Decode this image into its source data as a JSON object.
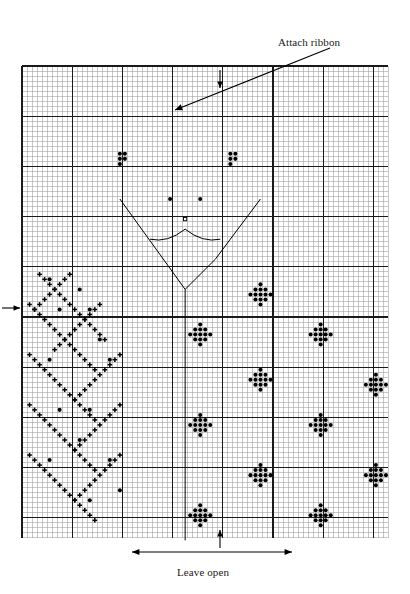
{
  "document": {
    "title": "Cross-stitch pattern chart",
    "type": "counted cross-stitch grid chart"
  },
  "annotations": {
    "attach_ribbon": {
      "text": "Attach ribbon",
      "icon": "arrow-pointer-icon",
      "points_to": "upper left area of grid"
    },
    "leave_open": {
      "text": "Leave open",
      "icon": "double-headed-arrow-icon",
      "spans": "bottom center edge of grid"
    },
    "top_marker": {
      "icon": "arrow-down-icon",
      "meaning": "vertical center top"
    },
    "bottom_marker": {
      "icon": "arrow-up-icon",
      "meaning": "vertical center bottom"
    },
    "left_marker": {
      "icon": "arrow-right-icon",
      "meaning": "horizontal center left"
    }
  },
  "colors": {
    "grid_minor": "#9a9a9a",
    "grid_major": "#1a1a1a",
    "symbol": "#000000",
    "background": "#ffffff",
    "text": "#1a1a1a"
  },
  "chart_data": {
    "type": "heatmap",
    "xlabel": "",
    "ylabel": "",
    "grid": true,
    "legend_position": "none",
    "cell_size_px": 5.02,
    "origin_px": {
      "x": 22,
      "y": 66
    },
    "columns": 73,
    "rows": 94,
    "major_gridline_interval": 10,
    "symbols": {
      "dot": "filled-round-stitch",
      "cross": "small-cross-stitch"
    },
    "motifs": {
      "flower": {
        "name": "diamond-flower-motif",
        "symbol": "dot",
        "offsets": [
          [
            0,
            -2
          ],
          [
            -1,
            -1
          ],
          [
            0,
            -1
          ],
          [
            1,
            -1
          ],
          [
            -2,
            0
          ],
          [
            -1,
            0
          ],
          [
            1,
            0
          ],
          [
            2,
            0
          ],
          [
            -1,
            1
          ],
          [
            0,
            1
          ],
          [
            1,
            1
          ],
          [
            0,
            2
          ]
        ]
      },
      "small_cross": {
        "name": "small-cross-motif",
        "symbol": "cross",
        "offsets": [
          [
            0,
            0
          ]
        ]
      },
      "eye_cluster": {
        "name": "eye-cluster-motif",
        "symbol": "dot",
        "offsets": [
          [
            0,
            0
          ],
          [
            1,
            0
          ],
          [
            0,
            1
          ],
          [
            1,
            1
          ],
          [
            0,
            2
          ]
        ]
      }
    },
    "flower_centers": [
      [
        47,
        45
      ],
      [
        35,
        53
      ],
      [
        59,
        53
      ],
      [
        47,
        62
      ],
      [
        70,
        63
      ],
      [
        35,
        71
      ],
      [
        59,
        71
      ],
      [
        47,
        81
      ],
      [
        70,
        81
      ],
      [
        35,
        89
      ],
      [
        59,
        89
      ]
    ],
    "eye_clusters": [
      [
        19,
        17
      ],
      [
        41,
        17
      ]
    ],
    "pupils": [
      [
        29,
        26
      ],
      [
        35,
        26
      ]
    ],
    "nose": [
      [
        32,
        30
      ]
    ],
    "mouth_curve": {
      "left_start": [
        25,
        34
      ],
      "dip": [
        32,
        32
      ],
      "right_end": [
        39,
        34
      ]
    },
    "chevron": {
      "left": [
        19,
        26
      ],
      "vertex": [
        32,
        44
      ],
      "right": [
        47,
        26
      ],
      "notch": [
        38,
        38
      ]
    },
    "center_line": {
      "x": 32,
      "from_y": 44,
      "to_y": 94
    },
    "cross_field_diagonals": [
      {
        "start": [
          3,
          41
        ],
        "dx": 1,
        "dy": 1,
        "count": 14
      },
      {
        "start": [
          1,
          47
        ],
        "dx": 1,
        "dy": 1,
        "count": 14
      },
      {
        "start": [
          1,
          57
        ],
        "dx": 1,
        "dy": 1,
        "count": 14
      },
      {
        "start": [
          1,
          67
        ],
        "dx": 1,
        "dy": 1,
        "count": 14
      },
      {
        "start": [
          1,
          77
        ],
        "dx": 1,
        "dy": 1,
        "count": 14
      },
      {
        "start": [
          9,
          41
        ],
        "dx": -1,
        "dy": 1,
        "count": 8
      },
      {
        "start": [
          15,
          47
        ],
        "dx": -1,
        "dy": 1,
        "count": 10
      },
      {
        "start": [
          19,
          57
        ],
        "dx": -1,
        "dy": 1,
        "count": 10
      },
      {
        "start": [
          19,
          67
        ],
        "dx": -1,
        "dy": 1,
        "count": 10
      },
      {
        "start": [
          19,
          77
        ],
        "dx": -1,
        "dy": 1,
        "count": 10
      }
    ]
  }
}
